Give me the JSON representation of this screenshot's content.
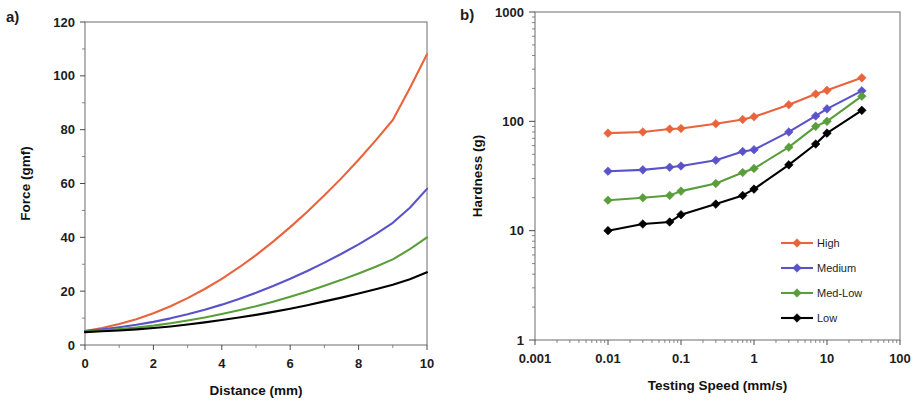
{
  "figure": {
    "panel_a_tag": "a)",
    "panel_b_tag": "b)"
  },
  "colors": {
    "high": "#E8643C",
    "medium": "#5A52C8",
    "med_low": "#5A9E3C",
    "low": "#000000",
    "axis": "#4a4a4a",
    "text": "#1d1d1d"
  },
  "chart_data": [
    {
      "id": "panel_a",
      "type": "line",
      "title": "",
      "xlabel": "Distance (mm)",
      "ylabel": "Force (gmf)",
      "xlim": [
        0,
        10
      ],
      "ylim": [
        0,
        120
      ],
      "xticks": [
        "0",
        "2",
        "4",
        "6",
        "8",
        "10"
      ],
      "yticks": [
        "0",
        "20",
        "40",
        "60",
        "80",
        "100",
        "120"
      ],
      "xscale": "linear",
      "yscale": "linear",
      "grid": false,
      "legend": "none",
      "x": [
        0,
        0.5,
        1,
        1.5,
        2,
        2.5,
        3,
        3.5,
        4,
        4.5,
        5,
        5.5,
        6,
        6.5,
        7,
        7.5,
        8,
        8.5,
        9,
        9.5,
        10
      ],
      "series": [
        {
          "name": "High",
          "color": "#E8643C",
          "values": [
            5.2,
            6.3,
            7.8,
            9.6,
            11.8,
            14.4,
            17.4,
            20.8,
            24.6,
            28.8,
            33.4,
            38.4,
            43.8,
            49.5,
            55.6,
            62.0,
            68.8,
            76.0,
            83.6,
            95.5,
            108.0
          ]
        },
        {
          "name": "Medium",
          "color": "#5A52C8",
          "values": [
            5.2,
            5.8,
            6.6,
            7.5,
            8.6,
            9.9,
            11.4,
            13.1,
            15.0,
            17.1,
            19.4,
            21.9,
            24.6,
            27.5,
            30.6,
            33.9,
            37.4,
            41.2,
            45.4,
            51.0,
            58.0
          ]
        },
        {
          "name": "Med-Low",
          "color": "#5A9E3C",
          "values": [
            5.0,
            5.4,
            5.9,
            6.5,
            7.2,
            8.1,
            9.1,
            10.2,
            11.5,
            12.9,
            14.4,
            16.1,
            17.9,
            19.9,
            22.0,
            24.2,
            26.6,
            29.1,
            31.8,
            35.6,
            40.0
          ]
        },
        {
          "name": "Low",
          "color": "#000000",
          "values": [
            4.8,
            5.1,
            5.4,
            5.8,
            6.3,
            6.9,
            7.6,
            8.4,
            9.3,
            10.2,
            11.2,
            12.3,
            13.5,
            14.8,
            16.2,
            17.6,
            19.1,
            20.7,
            22.4,
            24.4,
            27.0
          ]
        }
      ]
    },
    {
      "id": "panel_b",
      "type": "line",
      "title": "",
      "xlabel": "Testing Speed (mm/s)",
      "ylabel": "Hardness (g)",
      "xlim": [
        0.001,
        100
      ],
      "ylim": [
        1,
        1000
      ],
      "xscale": "log",
      "yscale": "log",
      "xticks": [
        "0.001",
        "0.01",
        "0.1",
        "1",
        "10",
        "100"
      ],
      "yticks": [
        "1",
        "10",
        "100",
        "1000"
      ],
      "grid": false,
      "legend": "inside-bottom-right",
      "markers": "diamond",
      "x": [
        0.01,
        0.03,
        0.07,
        0.1,
        0.3,
        0.7,
        1,
        3,
        7,
        10,
        30
      ],
      "series": [
        {
          "name": "High",
          "color": "#E8643C",
          "values": [
            78,
            80,
            85,
            86,
            95,
            104,
            110,
            142,
            178,
            192,
            250
          ]
        },
        {
          "name": "Medium",
          "color": "#5A52C8",
          "values": [
            35,
            36,
            38,
            39,
            44,
            53,
            55,
            80,
            112,
            130,
            190
          ]
        },
        {
          "name": "Med-Low",
          "color": "#5A9E3C",
          "values": [
            19,
            20,
            21,
            23,
            27,
            34,
            37,
            58,
            90,
            100,
            170
          ]
        },
        {
          "name": "Low",
          "color": "#000000",
          "values": [
            10,
            11.5,
            12,
            14,
            17.5,
            21,
            24,
            40,
            62,
            78,
            126
          ]
        }
      ]
    }
  ]
}
